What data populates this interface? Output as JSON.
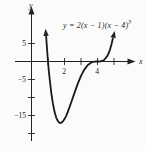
{
  "figure": {
    "background": "#fbfbfb",
    "ink": "#222222",
    "curve_color": "#1a1a1a",
    "axis_labels": {
      "x": "x",
      "y": "y"
    },
    "equation": {
      "body": "y = 2(x − 1)(x − 4)",
      "exponent": "3"
    }
  },
  "chart_data": {
    "type": "line",
    "title": "",
    "equation": "y = 2(x − 1)(x − 4)^3",
    "xlabel": "x",
    "ylabel": "y",
    "x_range": [
      -1,
      6.2
    ],
    "y_range": [
      -22,
      14
    ],
    "grid": false,
    "roots": [
      1,
      4
    ],
    "root_multiplicities": [
      1,
      3
    ],
    "minimum_point": [
      1.75,
      -17.09
    ],
    "x_ticks": [
      {
        "value": 1,
        "label": ""
      },
      {
        "value": 2,
        "label": "2"
      },
      {
        "value": 3,
        "label": ""
      },
      {
        "value": 4,
        "label": "4"
      },
      {
        "value": 5,
        "label": ""
      }
    ],
    "y_ticks": [
      {
        "value": 5,
        "label": "5"
      },
      {
        "value": -5,
        "label": "−5"
      },
      {
        "value": -10,
        "label": ""
      },
      {
        "value": -15,
        "label": "−15"
      },
      {
        "value": -20,
        "label": ""
      }
    ],
    "points": [
      [
        0.87,
        7.97
      ],
      [
        0.9,
        5.96
      ],
      [
        0.95,
        2.84
      ],
      [
        1.0,
        0.0
      ],
      [
        1.05,
        -2.57
      ],
      [
        1.1,
        -4.88
      ],
      [
        1.2,
        -8.78
      ],
      [
        1.3,
        -11.81
      ],
      [
        1.4,
        -14.06
      ],
      [
        1.5,
        -15.63
      ],
      [
        1.6,
        -16.59
      ],
      [
        1.7,
        -17.03
      ],
      [
        1.75,
        -17.09
      ],
      [
        1.8,
        -17.04
      ],
      [
        1.9,
        -16.67
      ],
      [
        2.0,
        -16.0
      ],
      [
        2.1,
        -15.09
      ],
      [
        2.2,
        -14.0
      ],
      [
        2.4,
        -11.47
      ],
      [
        2.6,
        -8.78
      ],
      [
        2.8,
        -6.22
      ],
      [
        3.0,
        -4.0
      ],
      [
        3.2,
        -2.25
      ],
      [
        3.4,
        -1.04
      ],
      [
        3.6,
        -0.33
      ],
      [
        3.8,
        -0.05
      ],
      [
        4.0,
        0.0
      ],
      [
        4.2,
        0.05
      ],
      [
        4.4,
        0.43
      ],
      [
        4.6,
        1.56
      ],
      [
        4.75,
        3.16
      ],
      [
        4.85,
        4.77
      ],
      [
        4.93,
        6.32
      ]
    ]
  }
}
